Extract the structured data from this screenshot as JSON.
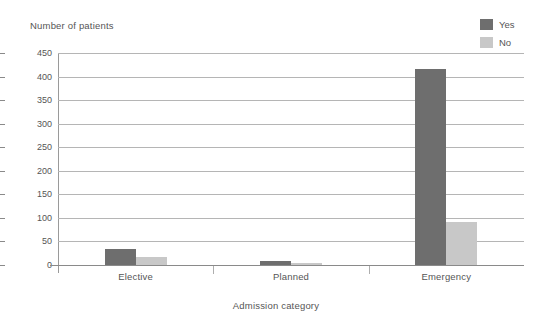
{
  "chart_data": {
    "type": "bar",
    "title": "",
    "xlabel": "Admission category",
    "ylabel": "Number of patients",
    "categories": [
      "Elective",
      "Planned",
      "Emergency"
    ],
    "series": [
      {
        "name": "Yes",
        "color": "#6e6e6e",
        "values": [
          33,
          9,
          417
        ]
      },
      {
        "name": "No",
        "color": "#c8c8c8",
        "values": [
          18,
          5,
          92
        ]
      }
    ],
    "ylim": [
      0,
      450
    ],
    "yticks": [
      0,
      50,
      100,
      150,
      200,
      250,
      300,
      350,
      400,
      450
    ],
    "ytick_labels": [
      "0",
      "50",
      "100",
      "150",
      "200",
      "250",
      "300",
      "350",
      "400",
      "450"
    ],
    "grid": true,
    "legend_position": "top-right"
  },
  "legend": {
    "entries": [
      {
        "label": "Yes",
        "color": "#6e6e6e"
      },
      {
        "label": "No",
        "color": "#c8c8c8"
      }
    ]
  }
}
